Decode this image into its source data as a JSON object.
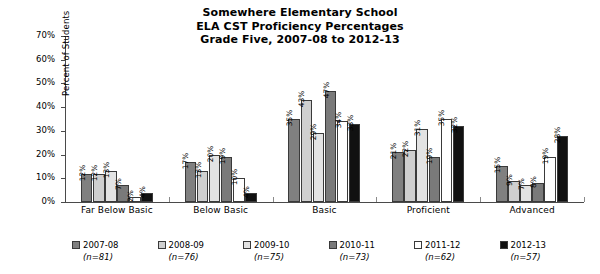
{
  "chart_data": {
    "type": "bar",
    "title": "Somewhere Elementary School ELA CST Proficiency Percentages Grade Five, 2007-08 to 2012-13",
    "title_lines": [
      "Somewhere Elementary School",
      "ELA CST Proficiency Percentages",
      "Grade Five, 2007-08 to 2012-13"
    ],
    "xlabel": "",
    "ylabel": "Percent of Students",
    "ylim": [
      0,
      70
    ],
    "ytick_step": 10,
    "ytick_labels": [
      "0%",
      "10%",
      "20%",
      "30%",
      "40%",
      "50%",
      "60%",
      "70%"
    ],
    "grid": false,
    "legend_position": "bottom",
    "categories": [
      "Far Below Basic",
      "Below Basic",
      "Basic",
      "Proficient",
      "Advanced"
    ],
    "series": [
      {
        "name": "2007-08",
        "n_label": "(n=81)",
        "color": "#808080",
        "values": [
          12,
          17,
          35,
          21,
          15
        ],
        "value_labels": [
          "12%",
          "17%",
          "35%",
          "21%",
          "15%"
        ]
      },
      {
        "name": "2008-09",
        "n_label": "(n=76)",
        "color": "#cfcfcf",
        "values": [
          12,
          13,
          43,
          22,
          9
        ],
        "value_labels": [
          "12%",
          "13%",
          "43%",
          "22%",
          "9%"
        ]
      },
      {
        "name": "2009-10",
        "n_label": "(n=75)",
        "color": "#e3e3e3",
        "values": [
          13,
          20,
          29,
          31,
          7
        ],
        "value_labels": [
          "13%",
          "20%",
          "29%",
          "31%",
          "7%"
        ]
      },
      {
        "name": "2010-11",
        "n_label": "(n=73)",
        "color": "#7a7a7a",
        "values": [
          7,
          19,
          47,
          19,
          8
        ],
        "value_labels": [
          "7%",
          "19%",
          "47%",
          "19%",
          "8%"
        ]
      },
      {
        "name": "2011-12",
        "n_label": "(n=62)",
        "color": "#ffffff",
        "values": [
          2,
          10,
          34,
          35,
          19
        ],
        "value_labels": [
          "2%",
          "10%",
          "34%",
          "35%",
          "19%"
        ]
      },
      {
        "name": "2012-13",
        "n_label": "(n=57)",
        "color": "#111111",
        "values": [
          4,
          4,
          33,
          32,
          28
        ],
        "value_labels": [
          "4%",
          "4%",
          "33%",
          "32%",
          "28%"
        ]
      }
    ]
  }
}
